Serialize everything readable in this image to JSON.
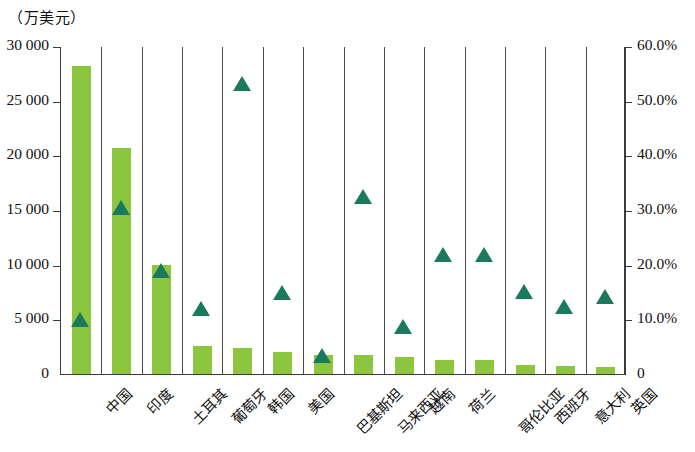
{
  "chart_data": {
    "type": "bar",
    "title": "",
    "unit_caption": "（万美元）",
    "ylabel": "",
    "xlabel": "",
    "grid": false,
    "legend_position": "none",
    "categories": [
      "中国",
      "印度",
      "土耳其",
      "葡萄牙",
      "韩国",
      "美国",
      "巴基斯坦",
      "马来西亚",
      "越南",
      "荷兰",
      "哥伦比亚",
      "西班牙",
      "意大利",
      "英国"
    ],
    "y_left": {
      "label": "（万美元）",
      "min": 0,
      "max": 30000,
      "tick_step": 5000,
      "tick_labels": [
        "30 000",
        "25 000",
        "20 000",
        "15 000",
        "10 000",
        "5 000",
        "0"
      ],
      "tick_values": [
        30000,
        25000,
        20000,
        15000,
        10000,
        5000,
        0
      ]
    },
    "y_right": {
      "label": "",
      "min": 0,
      "max": 60,
      "tick_step": 10,
      "tick_labels": [
        "60.0%",
        "50.0%",
        "40.0%",
        "30.0%",
        "20.0%",
        "10.0%",
        "0"
      ],
      "tick_values": [
        60,
        50,
        40,
        30,
        20,
        10,
        0
      ]
    },
    "series": [
      {
        "name": "金额",
        "type": "bar",
        "axis": "left",
        "color": "#8cc63e",
        "values": [
          28200,
          20700,
          10000,
          2600,
          2400,
          2000,
          1700,
          1700,
          1600,
          1300,
          1250,
          800,
          700,
          600
        ]
      },
      {
        "name": "占比",
        "type": "marker",
        "axis": "right",
        "color": "#1b7a5d",
        "marker": "triangle",
        "values": [
          10.0,
          30.5,
          19.0,
          12.0,
          53.2,
          15.0,
          3.5,
          32.5,
          8.8,
          22.0,
          22.0,
          15.2,
          12.5,
          14.3
        ]
      }
    ]
  },
  "colors": {
    "bar": "#8cc63e",
    "marker": "#1b7a5d",
    "axis": "#3b3b3b",
    "text": "#111111",
    "background": "#ffffff"
  }
}
